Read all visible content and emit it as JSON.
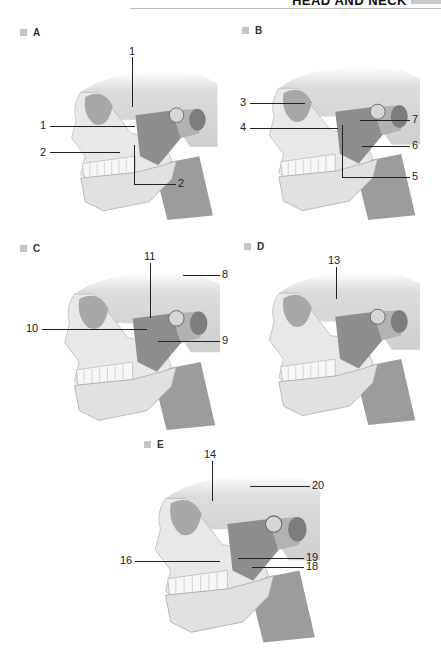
{
  "header": {
    "title": "HEAD AND NECK"
  },
  "panels": {
    "A": {
      "label": "A",
      "callouts": [
        "1",
        "1",
        "2",
        "2"
      ]
    },
    "B": {
      "label": "B",
      "callouts": [
        "3",
        "4",
        "7",
        "6",
        "5"
      ]
    },
    "C": {
      "label": "C",
      "callouts": [
        "11",
        "8",
        "10",
        "9"
      ]
    },
    "D": {
      "label": "D",
      "callouts": [
        "13"
      ]
    },
    "E": {
      "label": "E",
      "callouts": [
        "14",
        "20",
        "16",
        "19",
        "18"
      ]
    }
  },
  "colors": {
    "bone": "#e9e9e9",
    "bone_shade": "#bdbdbd",
    "muscle": "#8f8f8f",
    "muscle_light": "#a9a9a9",
    "teeth": "#f7f7f7",
    "line": "#222222",
    "marker": "#c4c4c4"
  }
}
